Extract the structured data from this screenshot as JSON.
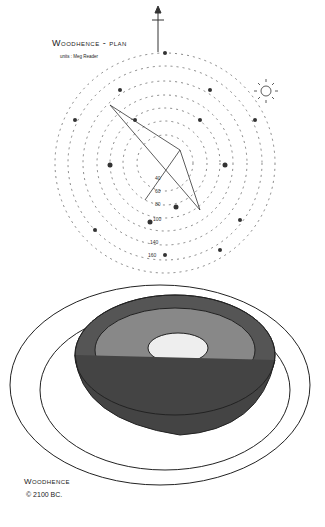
{
  "plan": {
    "title": "Woodhence - plan",
    "subtitle": "units : Meg Reader",
    "ring_labels": [
      "40",
      "60",
      "80",
      "100",
      "140",
      "160"
    ],
    "north_arrow": "north-arrow",
    "sun_symbol": "sun-icon"
  },
  "illustration": {
    "caption_title": "Woodhence",
    "caption_date": "© 2100 BC."
  }
}
